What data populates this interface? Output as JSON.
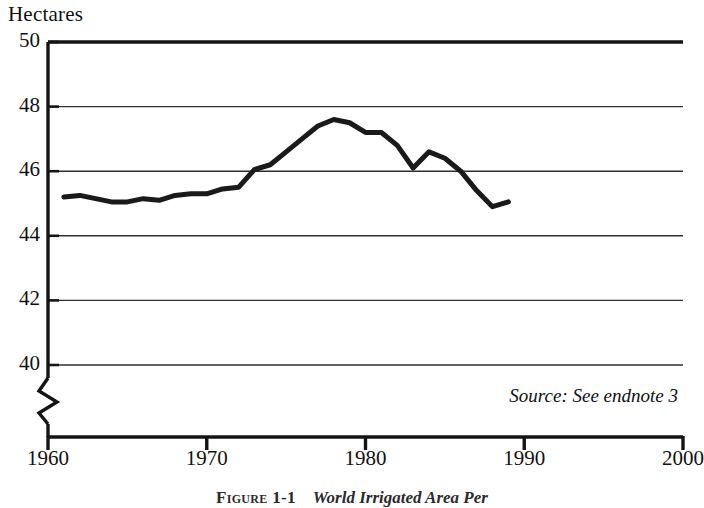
{
  "figure": {
    "y_axis_title": "Hectares",
    "source_note": "Source: See endnote 3",
    "caption_number": "Figure 1-1",
    "caption_title": "World Irrigated Area Per"
  },
  "chart_data": {
    "type": "line",
    "title": "World Irrigated Area Per",
    "xlabel": "",
    "ylabel": "Hectares",
    "xlim": [
      1960,
      2000
    ],
    "ylim": [
      39.2,
      50
    ],
    "yticks": [
      40,
      42,
      44,
      46,
      48,
      50
    ],
    "ytick_labels": [
      "40",
      "42",
      "44",
      "46",
      "48",
      "50"
    ],
    "xticks": [
      1960,
      1970,
      1980,
      1990,
      2000
    ],
    "xtick_labels": [
      "1960",
      "1970",
      "1980",
      "1990",
      "2000"
    ],
    "grid": "horizontal",
    "axis_break": true,
    "axis_break_below": 40,
    "legend": "none",
    "line_color": "#1a1a1a",
    "line_width_px": 5,
    "series": [
      {
        "name": "World irrigated area per thousand people (hectares)",
        "x": [
          1961,
          1962,
          1963,
          1964,
          1965,
          1966,
          1967,
          1968,
          1969,
          1970,
          1971,
          1972,
          1973,
          1974,
          1975,
          1976,
          1977,
          1978,
          1979,
          1980,
          1981,
          1982,
          1983,
          1984,
          1985,
          1986,
          1987,
          1988,
          1989
        ],
        "values": [
          45.2,
          45.25,
          45.15,
          45.05,
          45.05,
          45.15,
          45.1,
          45.25,
          45.3,
          45.3,
          45.45,
          45.5,
          46.05,
          46.2,
          46.6,
          47.0,
          47.4,
          47.6,
          47.5,
          47.2,
          47.2,
          46.8,
          46.1,
          46.6,
          46.4,
          46.0,
          45.4,
          44.9,
          45.05
        ]
      }
    ]
  },
  "geometry": {
    "plot_left_px": 48,
    "plot_right_px": 683,
    "y_top_value": 50,
    "y_top_px": 42,
    "px_per_unit": 32.3,
    "x_axis_px": 437,
    "break_top_px": 378,
    "break_bottom_px": 424
  }
}
